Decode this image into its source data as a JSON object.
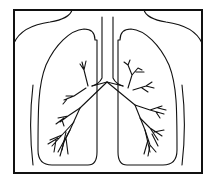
{
  "diagram": {
    "parts": [
      {
        "id": "frame",
        "label": "border frame"
      },
      {
        "id": "shoulders",
        "label": "neck and shoulder outline"
      },
      {
        "id": "trachea",
        "label": "trachea"
      },
      {
        "id": "left-lung",
        "label": "left lung outline"
      },
      {
        "id": "right-lung",
        "label": "right lung outline"
      },
      {
        "id": "left-bronchi",
        "label": "left bronchial tree"
      },
      {
        "id": "right-bronchi",
        "label": "right bronchial tree"
      },
      {
        "id": "body-sides",
        "label": "torso side lines"
      }
    ],
    "colors": {
      "line": "#111111",
      "background": "#ffffff"
    }
  }
}
